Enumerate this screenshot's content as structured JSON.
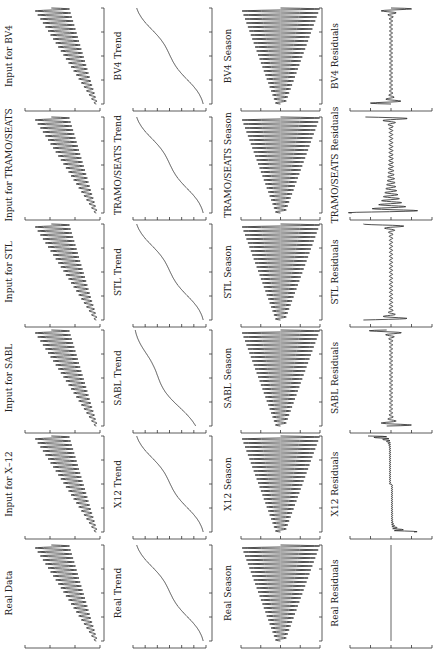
{
  "chart_data": {
    "type": "line",
    "title": "",
    "orientation_note": "figure rotated 90 degrees clockwise",
    "methods": [
      "BV4",
      "TRAMO/SEATS",
      "STL",
      "SABL",
      "X-12",
      "Real"
    ],
    "components": [
      "Input",
      "Trend",
      "Season",
      "Residuals"
    ],
    "panels": [
      {
        "method": "BV4",
        "titles": [
          "Input for BV4",
          "BV4 Trend",
          "BV4 Season",
          "BV4 Residuals"
        ]
      },
      {
        "method": "TRAMO/SEATS",
        "titles": [
          "Input for TRAMO/SEATS",
          "TRAMO/SEATS Trend",
          "TRAMO/SEATS Season",
          "TRAMO/SEATS Residuals"
        ]
      },
      {
        "method": "STL",
        "titles": [
          "Input for STL",
          "STL Trend",
          "STL Season",
          "STL Residuals"
        ]
      },
      {
        "method": "SABL",
        "titles": [
          "Input for SABL",
          "SABL Trend",
          "SABL Season",
          "SABL Residuals"
        ]
      },
      {
        "method": "X-12",
        "titles": [
          "Input for X–12",
          "X12 Trend",
          "X12 Season",
          "X12 Residuals"
        ]
      },
      {
        "method": "Real",
        "titles": [
          "Real Data",
          "Real Trend",
          "Real Season",
          "Real Residuals"
        ]
      }
    ],
    "series_shape": {
      "input": "increasing trend plus seasonal oscillation with growing amplitude",
      "trend": "S-shaped curve: rises, plateaus in middle, rises again",
      "season": "oscillation with linearly growing amplitude",
      "residuals": "near zero with spikes at series ends (Real residuals flat zero)"
    },
    "n_periods": 24,
    "time_ticks": 5,
    "value_ticks": {
      "Input": 4,
      "Trend": 7,
      "Season": 5,
      "Residuals": 5
    },
    "residual_profiles": {
      "BV4": "small spikes at both ends",
      "TRAMO/SEATS": "large spike at start, decaying dense band",
      "STL": "spikes at both ends",
      "SABL": "spikes at both ends, larger at end",
      "X-12": "large one-sided spikes at both ends",
      "Real": "zero"
    }
  }
}
